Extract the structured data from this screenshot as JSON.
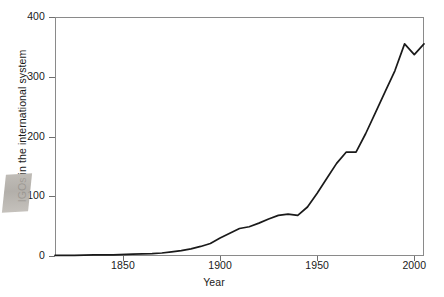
{
  "chart_data": {
    "type": "line",
    "title": "",
    "xlabel": "Year",
    "ylabel": "IGOs in the international system",
    "xlim": [
      1815,
      2005
    ],
    "ylim": [
      0,
      400
    ],
    "xticks": [
      1850,
      1900,
      1950,
      2000
    ],
    "xtick_labels": [
      "1850",
      "1900",
      "1950",
      "2000"
    ],
    "yticks": [
      0,
      100,
      200,
      300,
      400
    ],
    "ytick_labels": [
      "0",
      "100",
      "200",
      "300",
      "400"
    ],
    "grid": false,
    "legend": null,
    "line_color": "#1a1a1a",
    "series": [
      {
        "name": "IGOs in the international system",
        "x": [
          1815,
          1825,
          1835,
          1845,
          1855,
          1865,
          1870,
          1875,
          1880,
          1885,
          1890,
          1895,
          1900,
          1905,
          1910,
          1915,
          1920,
          1925,
          1930,
          1935,
          1940,
          1945,
          1950,
          1955,
          1960,
          1965,
          1970,
          1975,
          1980,
          1985,
          1990,
          1995,
          2000,
          2005
        ],
        "y": [
          1,
          1,
          2,
          2,
          3,
          4,
          5,
          7,
          9,
          12,
          16,
          21,
          30,
          38,
          46,
          49,
          55,
          62,
          68,
          70,
          68,
          82,
          105,
          130,
          155,
          174,
          174,
          205,
          240,
          275,
          310,
          355,
          337,
          355
        ]
      }
    ]
  },
  "artifact": {
    "name": "scan-smudge"
  }
}
